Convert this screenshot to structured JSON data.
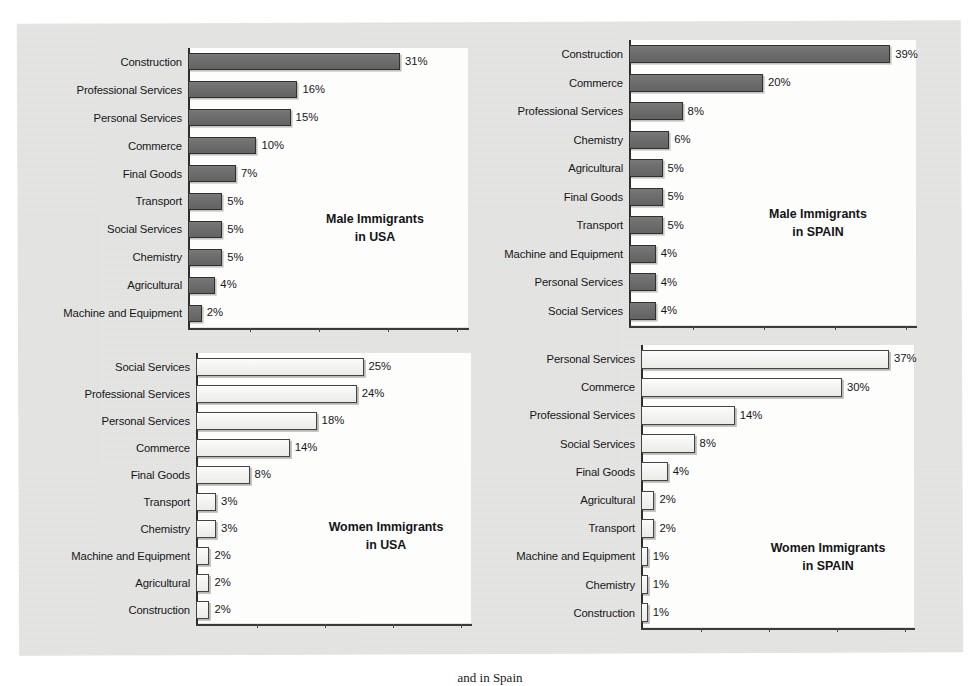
{
  "page": {
    "background_color": "#e6e6e4",
    "panel_color": "#e6e6e4",
    "plot_background_color": "#fdfdfc",
    "male_bar_color": "#6d6d6d",
    "female_bar_color": "#f2f2f0",
    "axis_color": "#2d2d2d",
    "text_color": "#17171a",
    "caption": "and in Spain"
  },
  "chart_data": [
    {
      "id": "male-usa",
      "type": "bar",
      "orientation": "horizontal",
      "title": "",
      "annotation": "Male Immigrants\nin USA",
      "annotation_line1": "Male Immigrants",
      "annotation_line2": "in USA",
      "series_name": "Male Immigrants in USA",
      "xlabel": "",
      "ylabel": "",
      "xlim": [
        0,
        42
      ],
      "grid": false,
      "legend": "none",
      "value_suffix": "%",
      "bar_style": "dark-gray",
      "categories": [
        "Construction",
        "Professional Services",
        "Personal Services",
        "Commerce",
        "Final Goods",
        "Transport",
        "Social Services",
        "Chemistry",
        "Agricultural",
        "Machine and Equipment"
      ],
      "values": [
        31,
        16,
        15,
        10,
        7,
        5,
        5,
        5,
        4,
        2
      ],
      "value_labels": [
        "31%",
        "16%",
        "15%",
        "10%",
        "7%",
        "5%",
        "5%",
        "5%",
        "4%",
        "2%"
      ]
    },
    {
      "id": "male-spain",
      "type": "bar",
      "orientation": "horizontal",
      "title": "",
      "annotation": "Male Immigrants\nin SPAIN",
      "annotation_line1": "Male Immigrants",
      "annotation_line2": "in SPAIN",
      "series_name": "Male Immigrants in SPAIN",
      "xlabel": "",
      "ylabel": "",
      "xlim": [
        0,
        42
      ],
      "grid": false,
      "legend": "none",
      "value_suffix": "%",
      "bar_style": "dark-gray",
      "categories": [
        "Construction",
        "Commerce",
        "Professional Services",
        "Chemistry",
        "Agricultural",
        "Final Goods",
        "Transport",
        "Machine and Equipment",
        "Personal Services",
        "Social Services"
      ],
      "values": [
        39,
        20,
        8,
        6,
        5,
        5,
        5,
        4,
        4,
        4
      ],
      "value_labels": [
        "39%",
        "20%",
        "8%",
        "6%",
        "5%",
        "5%",
        "5%",
        "4%",
        "4%",
        "4%"
      ]
    },
    {
      "id": "women-usa",
      "type": "bar",
      "orientation": "horizontal",
      "title": "",
      "annotation": "Women Immigrants\nin USA",
      "annotation_line1": "Women Immigrants",
      "annotation_line2": "in USA",
      "series_name": "Women Immigrants in USA",
      "xlabel": "",
      "ylabel": "",
      "xlim": [
        0,
        42
      ],
      "grid": false,
      "legend": "none",
      "value_suffix": "%",
      "bar_style": "light",
      "categories": [
        "Social Services",
        "Professional Services",
        "Personal Services",
        "Commerce",
        "Final Goods",
        "Transport",
        "Chemistry",
        "Machine and Equipment",
        "Agricultural",
        "Construction"
      ],
      "values": [
        25,
        24,
        18,
        14,
        8,
        3,
        3,
        2,
        2,
        2
      ],
      "value_labels": [
        "25%",
        "24%",
        "18%",
        "14%",
        "8%",
        "3%",
        "3%",
        "2%",
        "2%",
        "2%"
      ]
    },
    {
      "id": "women-spain",
      "type": "bar",
      "orientation": "horizontal",
      "title": "",
      "annotation": "Women Immigrants\nin SPAIN",
      "annotation_line1": "Women Immigrants",
      "annotation_line2": "in SPAIN",
      "series_name": "Women Immigrants in SPAIN",
      "xlabel": "",
      "ylabel": "",
      "xlim": [
        0,
        42
      ],
      "grid": false,
      "legend": "none",
      "value_suffix": "%",
      "bar_style": "light",
      "categories": [
        "Personal Services",
        "Commerce",
        "Professional Services",
        "Social Services",
        "Final Goods",
        "Agricultural",
        "Transport",
        "Machine and Equipment",
        "Chemistry",
        "Construction"
      ],
      "values": [
        37,
        30,
        14,
        8,
        4,
        2,
        2,
        1,
        1,
        1
      ],
      "value_labels": [
        "37%",
        "30%",
        "14%",
        "8%",
        "4%",
        "2%",
        "2%",
        "1%",
        "1%",
        "1%"
      ]
    }
  ]
}
